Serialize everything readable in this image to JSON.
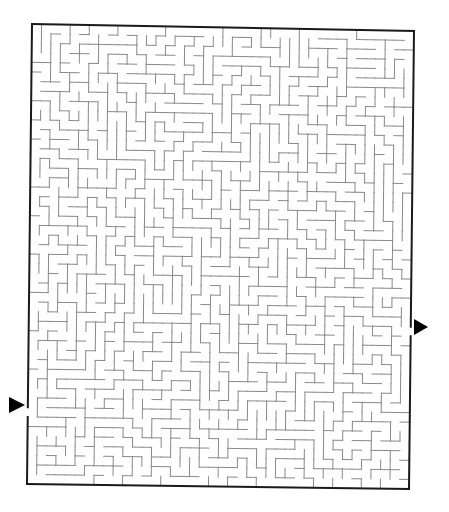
{
  "puzzle": {
    "type": "maze",
    "grid": {
      "cols": 40,
      "rows": 48
    },
    "seed": 7319,
    "frame": {
      "corners": {
        "top_left": [
          32,
          24
        ],
        "top_right": [
          414,
          31
        ],
        "bottom_right": [
          409,
          489
        ],
        "bottom_left": [
          27,
          484
        ]
      },
      "border_color": "#1a1a1a",
      "wall_color": "#8a8a8a"
    },
    "start": {
      "label": "start-arrow",
      "side": "left",
      "row": 40,
      "arrow_tip": [
        25,
        405
      ]
    },
    "finish": {
      "label": "finish-arrow",
      "side": "right",
      "row": 31,
      "arrow_tip": [
        428,
        327
      ]
    },
    "arrow_color": "#000000"
  }
}
